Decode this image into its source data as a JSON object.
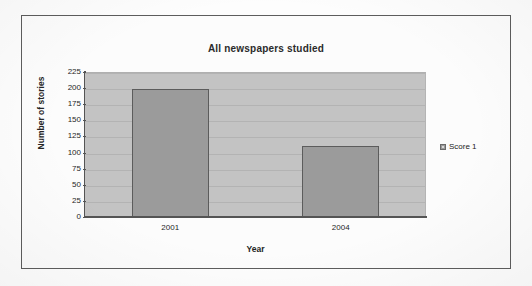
{
  "chart_data": {
    "type": "bar",
    "title": "All newspapers studied",
    "categories": [
      "2001",
      "2004"
    ],
    "values": [
      200,
      112
    ],
    "series": [
      {
        "name": "Score 1",
        "values": [
          200,
          112
        ]
      }
    ],
    "xlabel": "Year",
    "ylabel": "Number of stories",
    "ylim": [
      0,
      225
    ],
    "ytick_labels": [
      "225",
      "200",
      "175",
      "150",
      "125",
      "100",
      "75",
      "50",
      "25",
      "0"
    ],
    "ytick_values": [
      225,
      200,
      175,
      150,
      125,
      100,
      75,
      50,
      25,
      0
    ],
    "ytick_step": 25,
    "grid": true,
    "grid_axis": "y",
    "legend": {
      "position": "right",
      "entries": [
        {
          "label": "Score 1",
          "color": "#9b9b9b"
        }
      ]
    },
    "colors": {
      "bar_fill": "#9b9b9b",
      "bar_border": "#5c5c5c",
      "plot_background": "#c3c3c3",
      "gridline": "#b3b3b3",
      "axis": "#545454",
      "text": "#262626",
      "frame_border": "#5d5d5d",
      "page_background": "#fdfdfd"
    }
  }
}
